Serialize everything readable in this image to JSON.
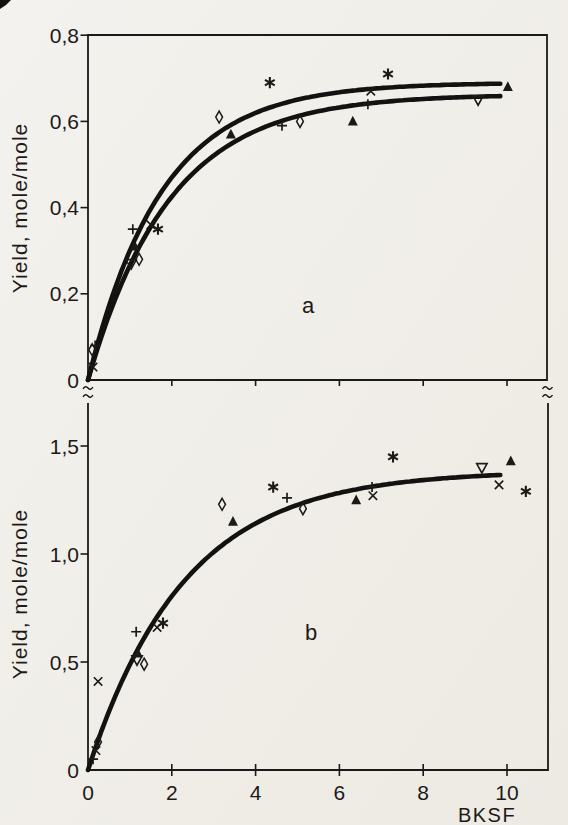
{
  "page": {
    "background": "#f1efe9",
    "ink": "#1c1a18",
    "curve_color": "#141210"
  },
  "figure": {
    "x_axis_label": "BKSF",
    "y_axis_label": "Yield, mole/mole",
    "panel_letters": [
      "a",
      "b"
    ]
  },
  "chart_data": [
    {
      "panel": "a",
      "type": "scatter",
      "title": "",
      "xlabel": "",
      "ylabel": "Yield, mole/mole",
      "annotation": "a",
      "grid": false,
      "legend": null,
      "xlim": [
        0,
        10.95
      ],
      "ylim": [
        0,
        0.8
      ],
      "x_ticks": [
        2,
        4,
        6,
        8,
        10
      ],
      "x_tick_labels": [],
      "y_ticks": [
        0,
        0.2,
        0.4,
        0.6,
        0.8
      ],
      "y_tick_labels": [
        "0",
        "0,2",
        "0,4",
        "0,6",
        "0,8"
      ],
      "series": [
        {
          "name": "plus-markers",
          "marker": "plus",
          "points": [
            [
              0.17,
              0.08
            ],
            [
              1.07,
              0.35
            ],
            [
              4.63,
              0.59
            ],
            [
              6.68,
              0.64
            ]
          ]
        },
        {
          "name": "cross-markers",
          "marker": "cross",
          "points": [
            [
              0.12,
              0.03
            ],
            [
              1.5,
              0.36
            ],
            [
              6.75,
              0.67
            ]
          ]
        },
        {
          "name": "asterisk-markers",
          "marker": "asterisk",
          "points": [
            [
              1.67,
              0.35
            ],
            [
              4.34,
              0.69
            ],
            [
              7.16,
              0.71
            ]
          ]
        },
        {
          "name": "open-diamond-markers",
          "marker": "diamond",
          "points": [
            [
              0.1,
              0.07
            ],
            [
              1.22,
              0.28
            ],
            [
              3.13,
              0.61
            ],
            [
              5.06,
              0.6
            ]
          ]
        },
        {
          "name": "filled-triangle-up-markers",
          "marker": "triangle-up",
          "points": [
            [
              1.12,
              0.31
            ],
            [
              3.41,
              0.57
            ],
            [
              6.32,
              0.6
            ],
            [
              10.02,
              0.68
            ]
          ]
        },
        {
          "name": "open-triangle-down-markers",
          "marker": "triangle-down",
          "points": [
            [
              1.03,
              0.27
            ],
            [
              9.31,
              0.65
            ]
          ]
        }
      ],
      "fit_curves": [
        {
          "name": "upper-fit",
          "model": "y = ymax*(1-exp(-x/tau))",
          "ymax": 0.69,
          "tau": 1.75,
          "x_range": [
            0,
            9.9
          ]
        },
        {
          "name": "lower-fit",
          "model": "y = ymax*(1-exp(-x/tau))",
          "ymax": 0.663,
          "tau": 1.95,
          "x_range": [
            0,
            9.9
          ]
        }
      ]
    },
    {
      "panel": "b",
      "type": "scatter",
      "title": "",
      "xlabel": "BKSF",
      "ylabel": "Yield, mole/mole",
      "annotation": "b",
      "grid": false,
      "legend": null,
      "xlim": [
        0,
        10.98
      ],
      "ylim": [
        0,
        1.7
      ],
      "x_ticks": [
        0,
        2,
        4,
        6,
        8,
        10
      ],
      "x_tick_labels": [
        "0",
        "2",
        "4",
        "6",
        "8",
        "10"
      ],
      "y_ticks": [
        0,
        0.5,
        1.0,
        1.5
      ],
      "y_tick_labels": [
        "0",
        "0,5",
        "1,0",
        "1,5"
      ],
      "series": [
        {
          "name": "plus-markers",
          "marker": "plus",
          "points": [
            [
              0.12,
              0.05
            ],
            [
              1.15,
              0.64
            ],
            [
              4.75,
              1.26
            ],
            [
              6.78,
              1.31
            ]
          ]
        },
        {
          "name": "cross-markers",
          "marker": "cross",
          "points": [
            [
              0.19,
              0.09
            ],
            [
              0.24,
              0.41
            ],
            [
              1.65,
              0.66
            ],
            [
              6.8,
              1.27
            ],
            [
              9.81,
              1.32
            ]
          ]
        },
        {
          "name": "asterisk-markers",
          "marker": "asterisk",
          "points": [
            [
              1.79,
              0.68
            ],
            [
              4.42,
              1.31
            ],
            [
              7.28,
              1.45
            ],
            [
              10.45,
              1.29
            ]
          ]
        },
        {
          "name": "open-diamond-markers",
          "marker": "diamond",
          "points": [
            [
              0.24,
              0.13
            ],
            [
              1.34,
              0.49
            ],
            [
              3.2,
              1.23
            ],
            [
              5.13,
              1.21
            ]
          ]
        },
        {
          "name": "filled-triangle-up-markers",
          "marker": "triangle-up",
          "points": [
            [
              1.19,
              0.54
            ],
            [
              3.46,
              1.15
            ],
            [
              6.4,
              1.25
            ],
            [
              10.09,
              1.43
            ]
          ]
        },
        {
          "name": "open-triangle-down-markers",
          "marker": "triangle-down",
          "points": [
            [
              1.17,
              0.51
            ],
            [
              9.4,
              1.4
            ]
          ]
        }
      ],
      "fit_curves": [
        {
          "name": "fit",
          "model": "y = ymax*(1-exp(-x/tau))",
          "ymax": 1.385,
          "tau": 2.3,
          "x_range": [
            0,
            9.85
          ]
        }
      ]
    }
  ]
}
